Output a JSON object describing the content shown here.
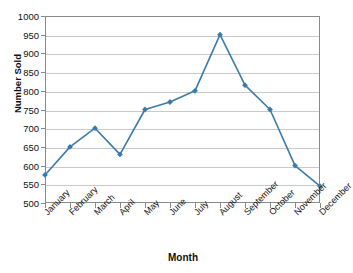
{
  "chart_data": {
    "type": "line",
    "title": "",
    "xlabel": "Month",
    "ylabel": "Number Sold",
    "categories": [
      "January",
      "February",
      "March",
      "April",
      "May",
      "June",
      "July",
      "August",
      "September",
      "October",
      "November",
      "December"
    ],
    "values": [
      575,
      650,
      700,
      630,
      750,
      770,
      800,
      950,
      815,
      750,
      600,
      545
    ],
    "series": [
      {
        "name": "Number Sold",
        "values": [
          575,
          650,
          700,
          630,
          750,
          770,
          800,
          950,
          815,
          750,
          600,
          545
        ]
      }
    ],
    "ylim": [
      500,
      1000
    ],
    "ytick_step": 50,
    "yticks": [
      1000,
      950,
      900,
      850,
      800,
      750,
      700,
      650,
      600,
      550,
      500
    ],
    "ytick_labels": [
      "1000",
      "950",
      "900",
      "850",
      "800",
      "750",
      "700",
      "650",
      "600",
      "550",
      "500"
    ],
    "grid": "horizontal",
    "legend": "none",
    "line_color": "#3c7ba8",
    "marker": "diamond",
    "marker_color": "#3c7ba8",
    "gridline_color": "#c9c9c9",
    "axis_color": "#8a8a8a",
    "xtick_label_rotation": -45
  }
}
